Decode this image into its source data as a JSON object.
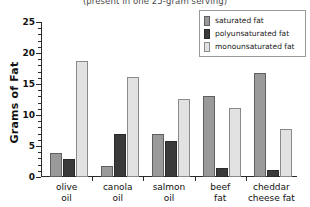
{
  "chart_data": {
    "type": "bar",
    "title": "(present in one 25-gram serving)",
    "xlabel": "",
    "ylabel": "Grams of Fat",
    "ylim": [
      0,
      25
    ],
    "ytick_labels": [
      "0",
      "5",
      "10",
      "15",
      "20",
      "25"
    ],
    "ytick_values": [
      0,
      5,
      10,
      15,
      20,
      25
    ],
    "minor_tick_step": 1,
    "grid": false,
    "legend_position": "top-right",
    "categories": [
      "olive\noil",
      "canola\noil",
      "salmon\noil",
      "beef\nfat",
      "cheddar\ncheese fat"
    ],
    "category_lines": [
      [
        "olive",
        "oil"
      ],
      [
        "canola",
        "oil"
      ],
      [
        "salmon",
        "oil"
      ],
      [
        "beef",
        "fat"
      ],
      [
        "cheddar",
        "cheese fat"
      ]
    ],
    "series": [
      {
        "name": "saturated fat",
        "color": "#9a9a9a",
        "values": [
          3.8,
          1.8,
          7.0,
          13.0,
          16.8
        ]
      },
      {
        "name": "polyunsaturated fat",
        "color": "#3a3a3a",
        "values": [
          2.9,
          7.0,
          5.8,
          1.5,
          1.1
        ]
      },
      {
        "name": "monounsaturated fat",
        "color": "#e2e2e2",
        "values": [
          18.7,
          16.2,
          12.6,
          11.2,
          7.8
        ]
      }
    ]
  }
}
